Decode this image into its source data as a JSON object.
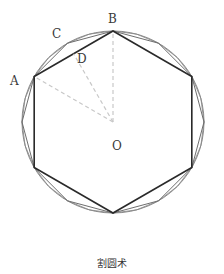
{
  "diagram": {
    "caption": "割圆术",
    "labels": {
      "A": "A",
      "B": "B",
      "C": "C",
      "D": "D",
      "O": "O"
    },
    "colors": {
      "hexagon": "#2a2a2a",
      "polygons": "#7a7a7a",
      "circle": "#8a8a8a",
      "dashed": "#c8c8c8"
    }
  }
}
